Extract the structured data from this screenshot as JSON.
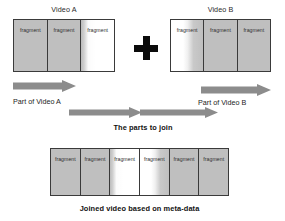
{
  "figure": {
    "title_video_a": "Video A",
    "title_video_b": "Video B",
    "label_part_a": "Part of Video A",
    "label_part_b": "Part of Video B",
    "label_parts_to_join": "The parts to join",
    "caption_joined": "Joined video based on meta-data",
    "plus_symbol": "+",
    "fragment_label": "fragment",
    "colors": {
      "fragment_gray": "#bfbfbf",
      "fragment_white": "#ffffff",
      "border": "#3a3a3a",
      "arrow": "#8c8c8c",
      "plus": "#0b0b0b",
      "text": "#242424",
      "background": "#ffffff"
    }
  },
  "video_a": {
    "title": "Video A",
    "fragments": [
      {
        "label": "fragment",
        "shade": "gray"
      },
      {
        "label": "fragment",
        "shade": "gray"
      },
      {
        "label": "fragment",
        "shade": "fade-right"
      }
    ]
  },
  "video_b": {
    "title": "Video B",
    "fragments": [
      {
        "label": "fragment",
        "shade": "fade-left"
      },
      {
        "label": "fragment",
        "shade": "gray"
      },
      {
        "label": "fragment",
        "shade": "gray"
      }
    ]
  },
  "joined_video": {
    "caption": "Joined video based on meta-data",
    "fragments": [
      {
        "label": "fragment",
        "shade": "gray"
      },
      {
        "label": "fragment",
        "shade": "gray"
      },
      {
        "label": "fragment",
        "shade": "fade-right"
      },
      {
        "label": "fragment",
        "shade": "fade-left"
      },
      {
        "label": "fragment",
        "shade": "gray"
      },
      {
        "label": "fragment",
        "shade": "gray"
      }
    ]
  },
  "arrows": [
    {
      "name": "arrow-part-of-video-a",
      "label": "Part of Video A",
      "direction": "right"
    },
    {
      "name": "arrow-part-of-video-b",
      "label": "Part of Video B",
      "direction": "right"
    },
    {
      "name": "arrow-join-left",
      "label": "",
      "direction": "right"
    },
    {
      "name": "arrow-join-right",
      "label": "",
      "direction": "right"
    }
  ]
}
